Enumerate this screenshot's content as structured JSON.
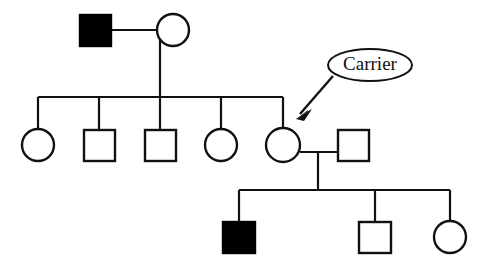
{
  "diagram": {
    "type": "pedigree",
    "background_color": "#ffffff",
    "line_color": "#111111",
    "affected_fill_color": "#000000",
    "unaffected_fill_color": "#ffffff"
  },
  "annotation": {
    "label": "Carrier",
    "shape": "ellipse",
    "points_to": "generation-2-individual-5",
    "arrow": "down-left"
  },
  "generations": [
    {
      "id": "generation-1",
      "individuals": [
        {
          "id": "g1-i1",
          "shape": "square",
          "sex": "male",
          "status": "affected",
          "filled": true,
          "cx": 95,
          "cy": 30
        },
        {
          "id": "g1-i2",
          "shape": "circle",
          "sex": "female",
          "status": "unaffected",
          "filled": false,
          "cx": 173,
          "cy": 30
        }
      ]
    },
    {
      "id": "generation-2",
      "individuals": [
        {
          "id": "g2-i1",
          "shape": "circle",
          "sex": "female",
          "status": "unaffected",
          "filled": false,
          "cx": 38,
          "cy": 145
        },
        {
          "id": "g2-i2",
          "shape": "square",
          "sex": "male",
          "status": "unaffected",
          "filled": false,
          "cx": 99,
          "cy": 145
        },
        {
          "id": "g2-i3",
          "shape": "square",
          "sex": "male",
          "status": "unaffected",
          "filled": false,
          "cx": 160,
          "cy": 145
        },
        {
          "id": "g2-i4",
          "shape": "circle",
          "sex": "female",
          "status": "unaffected",
          "filled": false,
          "cx": 221,
          "cy": 145
        },
        {
          "id": "g2-i5",
          "shape": "circle",
          "sex": "female",
          "status": "carrier",
          "filled": false,
          "cx": 283,
          "cy": 145
        },
        {
          "id": "g2-spouse",
          "shape": "square",
          "sex": "male",
          "status": "unaffected",
          "filled": false,
          "cx": 353,
          "cy": 145
        }
      ]
    },
    {
      "id": "generation-3",
      "individuals": [
        {
          "id": "g3-i1",
          "shape": "square",
          "sex": "male",
          "status": "affected",
          "filled": true,
          "cx": 239,
          "cy": 237
        },
        {
          "id": "g3-i2",
          "shape": "square",
          "sex": "male",
          "status": "unaffected",
          "filled": false,
          "cx": 375,
          "cy": 237
        },
        {
          "id": "g3-i3",
          "shape": "circle",
          "sex": "female",
          "status": "unaffected",
          "filled": false,
          "cx": 450,
          "cy": 237
        }
      ]
    }
  ],
  "counts": {
    "generation_1": 2,
    "generation_2": 6,
    "generation_3": 3,
    "affected_total": 2
  }
}
